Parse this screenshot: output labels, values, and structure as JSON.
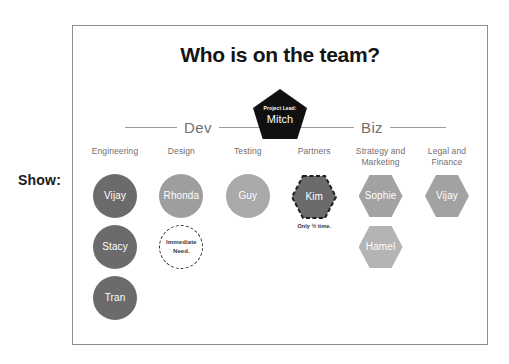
{
  "slide": {
    "show_label": "Show:"
  },
  "card": {
    "title": "Who is on the team?",
    "project_lead": {
      "role": "Project Lead:",
      "name": "Mitch"
    },
    "groups": [
      {
        "label": "Dev"
      },
      {
        "label": "Biz"
      }
    ],
    "columns": [
      {
        "header": "Engineering",
        "members": [
          {
            "name": "Vijay",
            "shape": "circle",
            "color": "#6b6b6b",
            "style": "solid",
            "note": ""
          },
          {
            "name": "Stacy",
            "shape": "circle",
            "color": "#6b6b6b",
            "style": "solid",
            "note": ""
          },
          {
            "name": "Tran",
            "shape": "circle",
            "color": "#6b6b6b",
            "style": "solid",
            "note": ""
          }
        ]
      },
      {
        "header": "Design",
        "members": [
          {
            "name": "Rhonda",
            "shape": "circle",
            "color": "#9e9e9e",
            "style": "solid",
            "note": ""
          },
          {
            "name": "Immediate Need.",
            "shape": "circle",
            "color": "#ffffff",
            "style": "dashed",
            "note": ""
          }
        ]
      },
      {
        "header": "Testing",
        "members": [
          {
            "name": "Guy",
            "shape": "circle",
            "color": "#a9a9a9",
            "style": "solid",
            "note": ""
          }
        ]
      },
      {
        "header": "Partners",
        "members": [
          {
            "name": "Kim",
            "shape": "hexagon",
            "color": "#6b6b6b",
            "style": "dashed",
            "note": "Only ½ time."
          }
        ]
      },
      {
        "header": "Strategy and Marketing",
        "members": [
          {
            "name": "Sophie",
            "shape": "hexagon",
            "color": "#a2a2a2",
            "style": "solid",
            "note": ""
          },
          {
            "name": "Hamel",
            "shape": "hexagon",
            "color": "#b4b4b4",
            "style": "solid",
            "note": ""
          }
        ]
      },
      {
        "header": "Legal and Finance",
        "members": [
          {
            "name": "Vijay",
            "shape": "hexagon",
            "color": "#a2a2a2",
            "style": "solid",
            "note": ""
          }
        ]
      }
    ]
  },
  "colors": {
    "dark_gray": "#6b6b6b",
    "mid_gray": "#9e9e9e",
    "light_gray": "#b4b4b4",
    "pentagon_black": "#101010",
    "rule_gray": "#9a9a9a",
    "card_border": "#8d8d8d"
  }
}
